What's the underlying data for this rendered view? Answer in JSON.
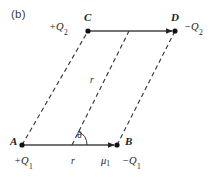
{
  "figure": {
    "panel_label": "(b)",
    "background_color": "#ffffff",
    "ink_color": "#222222",
    "vertices": [
      {
        "name": "A",
        "label": "A",
        "x": 22,
        "y": 145
      },
      {
        "name": "B",
        "label": "B",
        "x": 117,
        "y": 145
      },
      {
        "name": "C",
        "label": "C",
        "x": 88,
        "y": 31
      },
      {
        "name": "D",
        "label": "D",
        "x": 175,
        "y": 31
      }
    ],
    "vertex_labels": [
      {
        "id": "vertex-label-a",
        "text": "A",
        "x": 10,
        "y": 136
      },
      {
        "id": "vertex-label-b",
        "text": "B",
        "x": 125,
        "y": 136
      },
      {
        "id": "vertex-label-c",
        "text": "C",
        "x": 84,
        "y": 12
      },
      {
        "id": "vertex-label-d",
        "text": "D",
        "x": 171,
        "y": 12
      }
    ],
    "charge_labels": [
      {
        "id": "charge-label-a",
        "sign": "+",
        "symbol": "Q",
        "subscript": "1",
        "x": 14,
        "y": 158
      },
      {
        "id": "charge-label-b",
        "sign": "−",
        "symbol": "Q",
        "subscript": "1",
        "x": 122,
        "y": 158
      },
      {
        "id": "charge-label-c",
        "sign": "+",
        "symbol": "Q",
        "subscript": "2",
        "x": 50,
        "y": 23
      },
      {
        "id": "charge-label-d",
        "sign": "−",
        "symbol": "Q",
        "subscript": "2",
        "x": 185,
        "y": 23
      }
    ],
    "dipole_moment_label": {
      "text": "μ",
      "subscript": "1",
      "x": 104,
      "y": 157
    },
    "distance_labels": [
      {
        "id": "distance-label-baseline",
        "text": "r",
        "x": 72,
        "y": 157
      },
      {
        "id": "distance-label-diagonal",
        "text": "r",
        "x": 90,
        "y": 77
      }
    ],
    "angle_label": {
      "text": "θ",
      "x": 78,
      "y": 131
    },
    "angle": {
      "vertex_x": 72,
      "vertex_y": 145,
      "radius": 15,
      "start_deg": 0,
      "sweep_deg": 66
    },
    "solid_arrows": [
      {
        "id": "arrow-ab",
        "x1": 22,
        "y1": 145,
        "x2": 117,
        "y2": 145
      },
      {
        "id": "arrow-cd",
        "x1": 88,
        "y1": 31,
        "x2": 175,
        "y2": 31
      }
    ],
    "dashed_lines": [
      {
        "id": "dashed-ac",
        "x1": 22,
        "y1": 145,
        "x2": 88,
        "y2": 31
      },
      {
        "id": "dashed-bd",
        "x1": 117,
        "y1": 145,
        "x2": 175,
        "y2": 31
      },
      {
        "id": "dashed-diagonal",
        "x1": 72,
        "y1": 145,
        "x2": 129,
        "y2": 31
      }
    ]
  }
}
